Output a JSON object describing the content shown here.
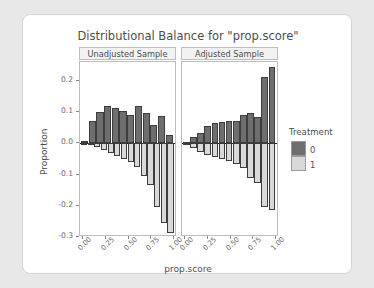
{
  "chart_data": {
    "type": "bar",
    "title": "Distributional Balance for \"prop.score\"",
    "xlabel": "prop.score",
    "ylabel": "Proportion",
    "xlim": [
      0.0,
      1.0
    ],
    "ylim": [
      -0.3,
      0.26
    ],
    "grid": false,
    "legend": {
      "title": "Treatment",
      "position": "right",
      "entries": [
        {
          "label": "0",
          "color": "#6e6e6e"
        },
        {
          "label": "1",
          "color": "#d9d9d9"
        }
      ]
    },
    "xticks": [
      "0.00",
      "0.25",
      "0.50",
      "0.75",
      "1.00"
    ],
    "xtick_values": [
      0.0,
      0.25,
      0.5,
      0.75,
      1.0
    ],
    "yticks": [
      "0.2",
      "0.1",
      "0.0",
      "-0.1",
      "-0.2",
      "-0.3"
    ],
    "ytick_values": [
      0.2,
      0.1,
      0.0,
      -0.1,
      -0.2,
      -0.3
    ],
    "panels": [
      {
        "label": "Unadjusted Sample",
        "bin_centers": [
          0.045,
          0.135,
          0.225,
          0.315,
          0.405,
          0.495,
          0.585,
          0.675,
          0.765,
          0.855,
          0.945
        ],
        "bin_width": 0.09,
        "series": [
          {
            "name": "0",
            "color": "#6e6e6e",
            "values": [
              0.008,
              0.07,
              0.1,
              0.118,
              0.114,
              0.103,
              0.089,
              0.118,
              0.098,
              0.058,
              0.086,
              0.028
            ]
          },
          {
            "name": "1",
            "color": "#d9d9d9",
            "values": [
              -0.004,
              -0.006,
              -0.011,
              -0.022,
              -0.032,
              -0.041,
              -0.05,
              -0.06,
              -0.075,
              -0.105,
              -0.133,
              -0.204,
              -0.255,
              -0.288
            ]
          }
        ]
      },
      {
        "label": "Adjusted Sample",
        "bin_centers": [
          0.045,
          0.135,
          0.225,
          0.315,
          0.405,
          0.495,
          0.585,
          0.675,
          0.765,
          0.855,
          0.945
        ],
        "bin_width": 0.09,
        "series": [
          {
            "name": "0",
            "color": "#6e6e6e",
            "values": [
              0.005,
              0.02,
              0.033,
              0.055,
              0.065,
              0.068,
              0.07,
              0.072,
              0.09,
              0.098,
              0.085,
              0.212,
              0.245
            ]
          },
          {
            "name": "1",
            "color": "#d9d9d9",
            "values": [
              -0.004,
              -0.015,
              -0.028,
              -0.038,
              -0.045,
              -0.051,
              -0.058,
              -0.065,
              -0.078,
              -0.11,
              -0.126,
              -0.204,
              -0.212
            ]
          }
        ]
      }
    ]
  }
}
